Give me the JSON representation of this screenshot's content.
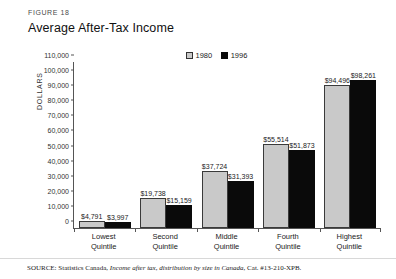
{
  "figure": {
    "label": "FIGURE 18",
    "title": "Average After-Tax Income"
  },
  "source": {
    "prefix": "SOURCE: Statistics Canada, ",
    "italic": "Income after tax, distribution by size in Canada",
    "suffix": ", Cat. #13-210-XPB."
  },
  "colors": {
    "series_1980": "#c9c9c9",
    "series_1996": "#0a0a0a",
    "axis": "#555555"
  },
  "chart_data": {
    "type": "bar",
    "title": "Average After-Tax Income",
    "xlabel": "",
    "ylabel": "DOLLARS",
    "ylim": [
      0,
      110000
    ],
    "ytick_step": 10000,
    "grid": false,
    "legend_position": "top-right",
    "categories": [
      "Lowest Quintile",
      "Second Quintile",
      "Middle Quintile",
      "Fourth Quintile",
      "Highest Quintile"
    ],
    "category_lines": [
      [
        "Lowest",
        "Quintile"
      ],
      [
        "Second",
        "Quintile"
      ],
      [
        "Middle",
        "Quintile"
      ],
      [
        "Fourth",
        "Quintile"
      ],
      [
        "Highest",
        "Quintile"
      ]
    ],
    "yticks": [
      "110,000",
      "100,000",
      "90,000",
      "80,000",
      "70,000",
      "60,000",
      "50,000",
      "40,000",
      "30,000",
      "20,000",
      "10,000",
      "0"
    ],
    "ytick_values": [
      110000,
      100000,
      90000,
      80000,
      70000,
      60000,
      50000,
      40000,
      30000,
      20000,
      10000,
      0
    ],
    "series": [
      {
        "name": "1980",
        "values": [
          4791,
          19738,
          37724,
          55514,
          94496
        ],
        "labels": [
          "$4,791",
          "$19,738",
          "$37,724",
          "$55,514",
          "$94,496"
        ]
      },
      {
        "name": "1996",
        "values": [
          3997,
          15159,
          31393,
          51873,
          98261
        ],
        "labels": [
          "$3,997",
          "$15,159",
          "$31,393",
          "$51,873",
          "$98,261"
        ]
      }
    ]
  }
}
